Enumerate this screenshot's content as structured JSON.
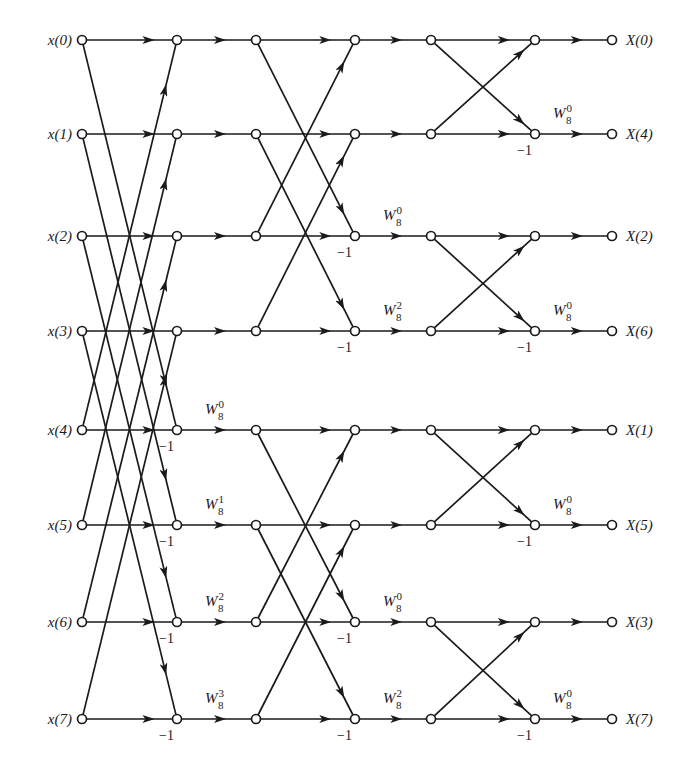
{
  "diagram": {
    "colors": {
      "ink": "#1a1a1a",
      "background": "#ffffff"
    },
    "columns_x": [
      82,
      177,
      256,
      355,
      431,
      535,
      612
    ],
    "rows_y": [
      40,
      134,
      236,
      331,
      430,
      525,
      622,
      719
    ],
    "inputs": [
      "x(0)",
      "x(1)",
      "x(2)",
      "x(3)",
      "x(4)",
      "x(5)",
      "x(6)",
      "x(7)"
    ],
    "outputs": [
      "X(0)",
      "X(4)",
      "X(2)",
      "X(6)",
      "X(1)",
      "X(5)",
      "X(3)",
      "X(7)"
    ],
    "stages": [
      {
        "name": "stage-1",
        "from_col": 0,
        "to_col": 1,
        "span": 4,
        "minus_one_rows": [
          4,
          5,
          6,
          7
        ],
        "twiddles": [
          {
            "row": 4,
            "label": "W",
            "sub": "8",
            "sup": "0"
          },
          {
            "row": 5,
            "label": "W",
            "sub": "8",
            "sup": "1"
          },
          {
            "row": 6,
            "label": "W",
            "sub": "8",
            "sup": "2"
          },
          {
            "row": 7,
            "label": "W",
            "sub": "8",
            "sup": "3"
          }
        ]
      },
      {
        "name": "stage-2",
        "from_col": 2,
        "to_col": 3,
        "span": 2,
        "minus_one_rows": [
          2,
          3,
          6,
          7
        ],
        "twiddles": [
          {
            "row": 2,
            "label": "W",
            "sub": "8",
            "sup": "0"
          },
          {
            "row": 3,
            "label": "W",
            "sub": "8",
            "sup": "2"
          },
          {
            "row": 6,
            "label": "W",
            "sub": "8",
            "sup": "0"
          },
          {
            "row": 7,
            "label": "W",
            "sub": "8",
            "sup": "2"
          }
        ]
      },
      {
        "name": "stage-3",
        "from_col": 4,
        "to_col": 5,
        "span": 1,
        "minus_one_rows": [
          1,
          3,
          5,
          7
        ],
        "twiddles": [
          {
            "row": 1,
            "label": "W",
            "sub": "8",
            "sup": "0"
          },
          {
            "row": 3,
            "label": "W",
            "sub": "8",
            "sup": "0"
          },
          {
            "row": 5,
            "label": "W",
            "sub": "8",
            "sup": "0"
          },
          {
            "row": 7,
            "label": "W",
            "sub": "8",
            "sup": "0"
          }
        ]
      }
    ],
    "minus_one_label": "−1"
  }
}
